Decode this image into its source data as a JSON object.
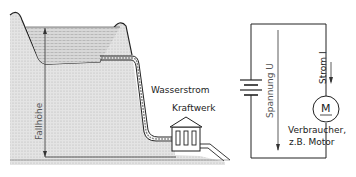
{
  "hydro": {
    "flow_label": "Wasserstrom",
    "plant_label": "Kraftwerk",
    "height_label": "Fallhöhe"
  },
  "circuit": {
    "voltage_label": "Spannung U",
    "current_label": "Strom I",
    "motor_symbol": "M",
    "consumer_label_line1": "Verbraucher,",
    "consumer_label_line2": "z.B. Motor"
  }
}
